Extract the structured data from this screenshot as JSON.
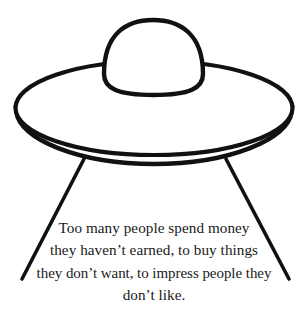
{
  "image": {
    "title": "UFO flying saucer line drawing with quote",
    "background_color": "#ffffff",
    "ink_color": "#111111",
    "width": 308,
    "height": 325
  },
  "illustration": {
    "subject": "ufo-flying-saucer",
    "style": "black-ink-outline",
    "parts": [
      {
        "name": "dome",
        "label": "cockpit dome"
      },
      {
        "name": "saucer-top",
        "label": "saucer top disc"
      },
      {
        "name": "saucer-rim",
        "label": "saucer rim band"
      },
      {
        "name": "leg-left",
        "label": "left landing leg"
      },
      {
        "name": "leg-right",
        "label": "right landing leg"
      }
    ]
  },
  "quote": {
    "lines": [
      "Too many people spend money",
      "they haven’t earned, to buy things",
      "they don’t want, to impress people they",
      "don’t like."
    ],
    "full_text": "Too many people spend money they haven’t earned, to buy things they don’t want, to impress people they don’t like.",
    "alignment": "center",
    "color": "#1a1a1a"
  }
}
